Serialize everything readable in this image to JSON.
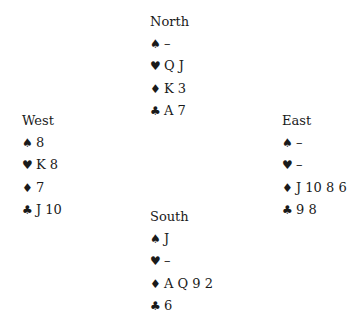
{
  "suits": {
    "spades": "♠",
    "hearts": "♥",
    "diamonds": "♦",
    "clubs": "♣"
  },
  "hands": {
    "north": {
      "name": "North",
      "spades": "–",
      "hearts": "Q J",
      "diamonds": "K 3",
      "clubs": "A 7"
    },
    "west": {
      "name": "West",
      "spades": "8",
      "hearts": "K 8",
      "diamonds": "7",
      "clubs": "J 10"
    },
    "east": {
      "name": "East",
      "spades": "–",
      "hearts": "–",
      "diamonds": "J 10 8 6",
      "clubs": "9 8"
    },
    "south": {
      "name": "South",
      "spades": "J",
      "hearts": "–",
      "diamonds": "A Q 9 2",
      "clubs": "6"
    }
  }
}
